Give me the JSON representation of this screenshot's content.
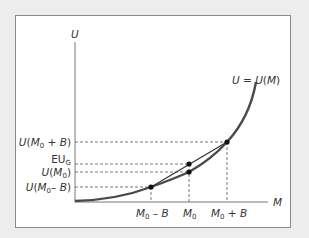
{
  "diagram": {
    "title": "",
    "y_axis_label": "U",
    "x_axis_label": "M",
    "curve_label": "U = U(M)",
    "y_labels": [
      {
        "id": "u_m0_plus_b",
        "text": "U(M0 + B)",
        "y": 142
      },
      {
        "id": "eu_g",
        "text": "EUG",
        "y": 164
      },
      {
        "id": "u_m0",
        "text": "U(M0)",
        "y": 172
      },
      {
        "id": "u_m0_minus_b",
        "text": "U(M0 – B)",
        "y": 187
      }
    ],
    "x_labels": [
      {
        "id": "m0_minus_b",
        "text": "M0 – B",
        "x": 151
      },
      {
        "id": "m0",
        "text": "M0",
        "x": 189
      },
      {
        "id": "m0_plus_b",
        "text": "M0 + B",
        "x": 227
      }
    ],
    "points": [
      {
        "name": "low-outcome",
        "x": 151,
        "y": 187
      },
      {
        "name": "certain-utility",
        "x": 189,
        "y": 172
      },
      {
        "name": "expected-utility",
        "x": 189,
        "y": 164
      },
      {
        "name": "high-outcome",
        "x": 227,
        "y": 142
      }
    ],
    "colors": {
      "background": "#ededed",
      "panel": "#ffffff",
      "curve": "#4a4a4a",
      "lines": "#333333",
      "dashes": "#555555"
    }
  },
  "labels": {
    "U": "U",
    "M": "M",
    "curve": "U = U(",
    "curve_M": "M",
    "curve_close": ")",
    "U_paren": "U(",
    "sub0": "0",
    "plus_B": " + ",
    "minus_B": "– ",
    "B": "B",
    "close": ")",
    "EU": "EU",
    "G": "G"
  }
}
